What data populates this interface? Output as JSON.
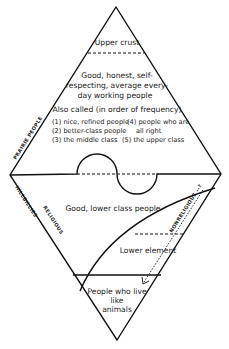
{
  "diagram": {
    "type": "social class diamond diagram",
    "upper_triangle": {
      "apex_label": "Upper crust",
      "middle_label_lines": [
        "Good, honest, self-",
        "respecting, average every-",
        "day working people"
      ],
      "also_called_heading": "Also called (in order of frequency)",
      "also_called_left": [
        "(1) nice, refined people",
        "(2) better-class people",
        "(3) the middle class"
      ],
      "also_called_right": [
        "(4) people who are",
        "all right",
        "(5) the upper class"
      ]
    },
    "lower_triangle": {
      "upper_label": "Good, lower class people",
      "middle_label": "Lower element",
      "bottom_label_lines": [
        "People who live",
        "like",
        "animals"
      ]
    },
    "side_labels": {
      "upper_left_edge": "PRAIRIE PEOPLE",
      "lower_left_edge": "HILLBILLIES",
      "inner_left": "RELIGIOUS",
      "inner_right_arrow": "NONRELIGIOUS --?"
    }
  }
}
